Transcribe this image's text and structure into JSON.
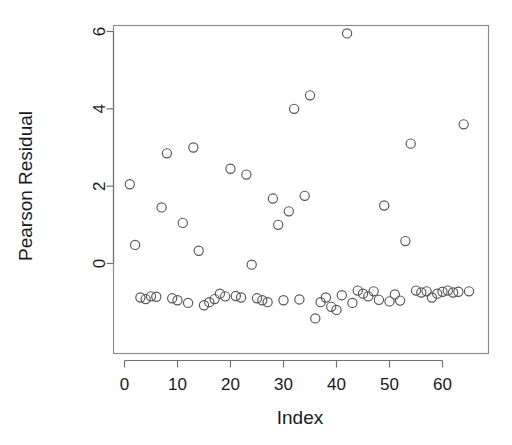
{
  "chart_data": {
    "type": "scatter",
    "title": "",
    "xlabel": "Index",
    "ylabel": "Pearson Residual",
    "xlim": [
      -1.0,
      67.0
    ],
    "ylim": [
      -1.62,
      6.35
    ],
    "xticks": [
      0,
      10,
      20,
      30,
      40,
      50,
      60
    ],
    "xticklabels": [
      "0",
      "10",
      "20",
      "30",
      "40",
      "50",
      "60"
    ],
    "yticks": [
      0,
      2,
      4,
      6
    ],
    "yticklabels": [
      "0",
      "2",
      "4",
      "6"
    ],
    "grid": false,
    "legend": null,
    "marker": "open-circle",
    "marker_color": "#555555",
    "background": "#ffffff",
    "n_points": 65,
    "series": [
      {
        "name": "Pearson residuals",
        "x": [
          1,
          2,
          3,
          4,
          5,
          6,
          7,
          8,
          9,
          10,
          11,
          12,
          13,
          14,
          15,
          16,
          17,
          18,
          19,
          20,
          21,
          22,
          23,
          24,
          25,
          26,
          27,
          28,
          29,
          30,
          31,
          32,
          33,
          34,
          35,
          36,
          37,
          38,
          39,
          40,
          41,
          42,
          43,
          44,
          45,
          46,
          47,
          48,
          49,
          50,
          51,
          52,
          53,
          54,
          55,
          56,
          57,
          58,
          59,
          60,
          61,
          62,
          63,
          64,
          65
        ],
        "y": [
          2.05,
          0.48,
          -0.88,
          -0.92,
          -0.85,
          -0.86,
          1.45,
          2.85,
          -0.9,
          -0.95,
          1.05,
          -1.02,
          3.0,
          0.33,
          -1.08,
          -1.0,
          -0.92,
          -0.78,
          -0.85,
          2.45,
          -0.84,
          -0.88,
          2.3,
          -0.03,
          -0.9,
          -0.95,
          -1.0,
          1.68,
          1.0,
          -0.95,
          1.35,
          4.0,
          -0.93,
          1.75,
          4.35,
          -1.42,
          -1.0,
          -0.88,
          -1.12,
          -1.2,
          -0.82,
          5.95,
          -1.02,
          -0.7,
          -0.78,
          -0.85,
          -0.72,
          -0.94,
          1.5,
          -0.98,
          -0.8,
          -0.96,
          0.58,
          3.1,
          -0.7,
          -0.75,
          -0.72,
          -0.88,
          -0.78,
          -0.73,
          -0.7,
          -0.75,
          -0.73,
          3.6,
          -0.72
        ]
      }
    ]
  },
  "axes": {
    "y_axis_title": "Pearson Residual",
    "x_axis_title": "Index"
  }
}
